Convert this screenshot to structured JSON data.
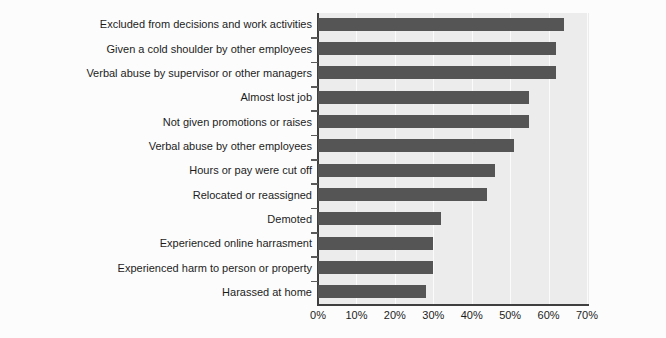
{
  "chart_data": {
    "type": "bar",
    "orientation": "horizontal",
    "title": "",
    "subtitle": "",
    "xlabel": "",
    "ylabel": "",
    "categories": [
      "Excluded from decisions and work activities",
      "Given a cold shoulder by other employees",
      "Verbal abuse by supervisor or other managers",
      "Almost lost job",
      "Not given promotions or raises",
      "Verbal abuse by other employees",
      "Hours or pay were cut off",
      "Relocated or reassigned",
      "Demoted",
      "Experienced online harrasment",
      "Experienced harm to person or property",
      "Harassed at home"
    ],
    "values": [
      64,
      62,
      62,
      55,
      55,
      51,
      46,
      44,
      32,
      30,
      30,
      28
    ],
    "value_unit": "%",
    "xlim": [
      0,
      70
    ],
    "xticks": [
      0,
      10,
      20,
      30,
      40,
      50,
      60,
      70
    ],
    "xtick_labels": [
      "0%",
      "10%",
      "20%",
      "30%",
      "40%",
      "50%",
      "60%",
      "70%"
    ],
    "grid": "vertical",
    "gridline_color": "#fbfbfb",
    "legend": null,
    "legend_position": "none",
    "bar_color": "#555555",
    "plot_background": "#ececec",
    "figure_background": "#fcfcfc",
    "axis_color": "#3f3f3f",
    "text_color": "#1c1c1c"
  }
}
